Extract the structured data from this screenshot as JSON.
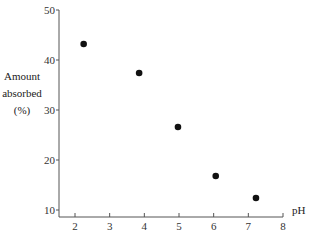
{
  "chart_data": {
    "type": "scatter",
    "title": "",
    "xlabel": "pH",
    "ylabel": [
      "Amount",
      "absorbed",
      "(%)"
    ],
    "xlim": [
      1.5,
      8
    ],
    "ylim": [
      10,
      50
    ],
    "xticks": [
      2,
      3,
      4,
      5,
      6,
      7,
      8
    ],
    "yticks": [
      10,
      20,
      30,
      40,
      50
    ],
    "grid": false,
    "legend": null,
    "series": [
      {
        "name": "Amount absorbed",
        "marker": "filled-circle",
        "color": "#111111",
        "points": [
          {
            "x": 2.25,
            "y": 43.2
          },
          {
            "x": 3.85,
            "y": 37.4
          },
          {
            "x": 4.97,
            "y": 26.6
          },
          {
            "x": 6.06,
            "y": 16.8
          },
          {
            "x": 7.22,
            "y": 12.4
          }
        ]
      }
    ]
  },
  "colors": {
    "axis": "#555555",
    "marker": "#111111",
    "text": "#222222"
  }
}
